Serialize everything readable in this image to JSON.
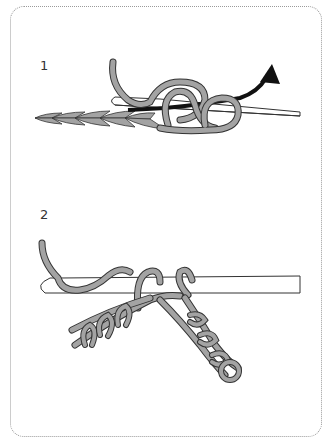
{
  "figure": {
    "steps": [
      {
        "label": "1",
        "description": "hook inserted through chain, yarn over, pull through (arrow)"
      },
      {
        "label": "2",
        "description": "hook with loops, chain folded into V shape"
      }
    ],
    "colors": {
      "yarn_fill": "#a3a3a3",
      "outline": "#333333",
      "hook_fill": "#ffffff",
      "arrow": "#111111",
      "border": "#9a9a9a"
    }
  }
}
